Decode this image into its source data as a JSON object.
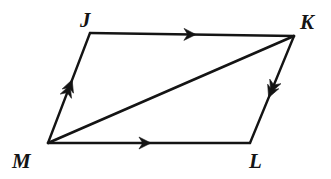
{
  "figure": {
    "kind": "parallelogram-with-diagonal",
    "name": "parallelogram-jklm",
    "background_color": "#ffffff",
    "stroke_color": "#141414",
    "vertices": [
      {
        "id": "J",
        "label": "J",
        "x": 90,
        "y": 33,
        "label_x": 80,
        "label_y": 27
      },
      {
        "id": "K",
        "label": "K",
        "x": 294,
        "y": 36,
        "label_x": 300,
        "label_y": 29
      },
      {
        "id": "L",
        "label": "L",
        "x": 250,
        "y": 143,
        "label_x": 249,
        "label_y": 168
      },
      {
        "id": "M",
        "label": "M",
        "x": 48,
        "y": 143,
        "label_x": 12,
        "label_y": 168
      }
    ],
    "edges": [
      {
        "id": "JK",
        "name": "edge-jk",
        "from": "J",
        "to": "K",
        "ticks": 1,
        "tick_t": 0.49
      },
      {
        "id": "KL",
        "name": "edge-kl",
        "from": "K",
        "to": "L",
        "ticks": 2,
        "tick_t": 0.5
      },
      {
        "id": "ML",
        "name": "edge-ml",
        "from": "M",
        "to": "L",
        "ticks": 1,
        "tick_t": 0.48
      },
      {
        "id": "MJ",
        "name": "edge-mj",
        "from": "M",
        "to": "J",
        "ticks": 2,
        "tick_t": 0.5
      }
    ],
    "diagonal": {
      "id": "MK",
      "name": "diagonal-mk",
      "from": "M",
      "to": "K",
      "ticks": 0
    }
  }
}
